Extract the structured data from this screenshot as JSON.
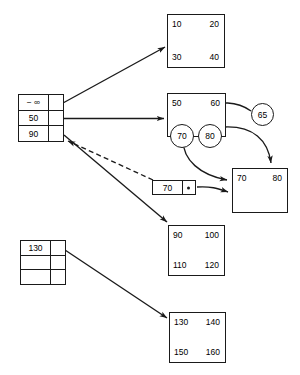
{
  "diagram": {
    "stroke_color": "#1a1a1a",
    "background": "#ffffff"
  },
  "root_node": {
    "name": "root-index-node",
    "rows": [
      {
        "key": "− ∞",
        "pointer": "ptr-0"
      },
      {
        "key": "50",
        "pointer": "ptr-1"
      },
      {
        "key": "90",
        "pointer": "ptr-2"
      }
    ]
  },
  "second_index_node": {
    "name": "secondary-index-node",
    "rows": [
      {
        "key": "130",
        "pointer": "ptr-0"
      },
      {
        "key": "",
        "pointer": ""
      },
      {
        "key": "",
        "pointer": ""
      }
    ]
  },
  "small_node": {
    "name": "inserted-separator-node",
    "key": "70",
    "pointer_glyph": "pointer-dot"
  },
  "leaf_nodes": [
    {
      "id": "leaf-10-40",
      "values": {
        "tl": "10",
        "tr": "20",
        "bl": "30",
        "br": "40"
      }
    },
    {
      "id": "leaf-50-60",
      "values": {
        "tl": "50",
        "tr": "60",
        "bl": "",
        "br": ""
      }
    },
    {
      "id": "leaf-70-80",
      "values": {
        "tl": "70",
        "tr": "80",
        "bl": "",
        "br": ""
      }
    },
    {
      "id": "leaf-90-120",
      "values": {
        "tl": "90",
        "tr": "100",
        "bl": "110",
        "br": "120"
      }
    },
    {
      "id": "leaf-130-160",
      "values": {
        "tl": "130",
        "tr": "140",
        "bl": "150",
        "br": "160"
      }
    }
  ],
  "circled_values": [
    {
      "id": "circle-70",
      "label": "70"
    },
    {
      "id": "circle-80",
      "label": "80"
    },
    {
      "id": "circle-65",
      "label": "65"
    }
  ],
  "edges": [
    {
      "id": "edge-root0-to-leaf-10-40",
      "style": "solid",
      "arrow": "end"
    },
    {
      "id": "edge-root1-to-leaf-50-60",
      "style": "solid",
      "arrow": "end"
    },
    {
      "id": "edge-root2-to-leaf-90-120",
      "style": "solid",
      "arrow": "end"
    },
    {
      "id": "edge-smallnode-to-root",
      "style": "dashed",
      "arrow": "end"
    },
    {
      "id": "edge-index130-to-leaf-130-160",
      "style": "solid",
      "arrow": "end"
    },
    {
      "id": "edge-circle65-to-leaf-50-60",
      "style": "curve",
      "arrow": "end"
    },
    {
      "id": "edge-circle80-to-leaf-70-80",
      "style": "curve",
      "arrow": "end"
    },
    {
      "id": "edge-circle70-to-leaf-70-80",
      "style": "curve",
      "arrow": "end"
    },
    {
      "id": "edge-smallnode-ptr-to-leaf-70-80",
      "style": "curve",
      "arrow": "end"
    }
  ]
}
